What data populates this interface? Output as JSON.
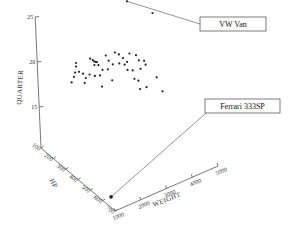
{
  "chart_data": {
    "type": "scatter",
    "projection": "3d",
    "title": "",
    "axes": {
      "x": {
        "label": "WEIGHT",
        "range": [
          1000,
          5000
        ],
        "ticks": [
          1000,
          2000,
          3000,
          4000,
          5000
        ]
      },
      "y": {
        "label": "HP",
        "range": [
          100,
          700
        ],
        "ticks": [
          100,
          200,
          300,
          400,
          500,
          600,
          700
        ]
      },
      "z": {
        "label": "QUARTER",
        "range": [
          10,
          25
        ],
        "ticks": [
          15,
          20,
          25
        ]
      }
    },
    "grid": false,
    "points": [
      {
        "WEIGHT": 2250,
        "HP": 150,
        "QUARTER": 18.9
      },
      {
        "WEIGHT": 2250,
        "HP": 150,
        "QUARTER": 18.5
      },
      {
        "WEIGHT": 2200,
        "HP": 150,
        "QUARTER": 17.9
      },
      {
        "WEIGHT": 2150,
        "HP": 150,
        "QUARTER": 17.5
      },
      {
        "WEIGHT": 2350,
        "HP": 150,
        "QUARTER": 17.8
      },
      {
        "WEIGHT": 2050,
        "HP": 150,
        "QUARTER": 17.0
      },
      {
        "WEIGHT": 2500,
        "HP": 150,
        "QUARTER": 17.4
      },
      {
        "WEIGHT": 2600,
        "HP": 150,
        "QUARTER": 16.8
      },
      {
        "WEIGHT": 2550,
        "HP": 150,
        "QUARTER": 16.3
      },
      {
        "WEIGHT": 2750,
        "HP": 150,
        "QUARTER": 17.0
      },
      {
        "WEIGHT": 2800,
        "HP": 150,
        "QUARTER": 18.7
      },
      {
        "WEIGHT": 2900,
        "HP": 150,
        "QUARTER": 18.4
      },
      {
        "WEIGHT": 2950,
        "HP": 150,
        "QUARTER": 18.2
      },
      {
        "WEIGHT": 3000,
        "HP": 150,
        "QUARTER": 18.1
      },
      {
        "WEIGHT": 3050,
        "HP": 150,
        "QUARTER": 18.0
      },
      {
        "WEIGHT": 2950,
        "HP": 150,
        "QUARTER": 17.8
      },
      {
        "WEIGHT": 3100,
        "HP": 150,
        "QUARTER": 17.6
      },
      {
        "WEIGHT": 2950,
        "HP": 150,
        "QUARTER": 16.6
      },
      {
        "WEIGHT": 3150,
        "HP": 150,
        "QUARTER": 16.4
      },
      {
        "WEIGHT": 3250,
        "HP": 150,
        "QUARTER": 16.9
      },
      {
        "WEIGHT": 3400,
        "HP": 150,
        "QUARTER": 18.3
      },
      {
        "WEIGHT": 3500,
        "HP": 150,
        "QUARTER": 17.6
      },
      {
        "WEIGHT": 3450,
        "HP": 150,
        "QUARTER": 16.7
      },
      {
        "WEIGHT": 3650,
        "HP": 150,
        "QUARTER": 17.0
      },
      {
        "WEIGHT": 3750,
        "HP": 150,
        "QUARTER": 18.2
      },
      {
        "WEIGHT": 3900,
        "HP": 150,
        "QUARTER": 17.8
      },
      {
        "WEIGHT": 3900,
        "HP": 150,
        "QUARTER": 16.8
      },
      {
        "WEIGHT": 4050,
        "HP": 150,
        "QUARTER": 17.2
      },
      {
        "WEIGHT": 4100,
        "HP": 150,
        "QUARTER": 16.4
      },
      {
        "WEIGHT": 4200,
        "HP": 150,
        "QUARTER": 16.6
      },
      {
        "WEIGHT": 4300,
        "HP": 150,
        "QUARTER": 17.4
      },
      {
        "WEIGHT": 4200,
        "HP": 150,
        "QUARTER": 15.7
      },
      {
        "WEIGHT": 4400,
        "HP": 150,
        "QUARTER": 15.4
      },
      {
        "WEIGHT": 4550,
        "HP": 150,
        "QUARTER": 16.9
      },
      {
        "WEIGHT": 4650,
        "HP": 150,
        "QUARTER": 16.2
      },
      {
        "WEIGHT": 4700,
        "HP": 150,
        "QUARTER": 15.2
      },
      {
        "WEIGHT": 4850,
        "HP": 150,
        "QUARTER": 15.9
      },
      {
        "WEIGHT": 4900,
        "HP": 150,
        "QUARTER": 15.4
      },
      {
        "WEIGHT": 4450,
        "HP": 150,
        "QUARTER": 14.4
      },
      {
        "WEIGHT": 4600,
        "HP": 150,
        "QUARTER": 14.0
      },
      {
        "WEIGHT": 4650,
        "HP": 150,
        "QUARTER": 13.0
      },
      {
        "WEIGHT": 4900,
        "HP": 150,
        "QUARTER": 12.9
      },
      {
        "WEIGHT": 5300,
        "HP": 150,
        "QUARTER": 13.5
      },
      {
        "WEIGHT": 5500,
        "HP": 150,
        "QUARTER": 11.7
      },
      {
        "WEIGHT": 5250,
        "HP": 150,
        "QUARTER": 20.7
      },
      {
        "WEIGHT": 3200,
        "HP": 150,
        "QUARTER": 15.1
      },
      {
        "WEIGHT": 3600,
        "HP": 150,
        "QUARTER": 15.3
      }
    ],
    "annotations": [
      {
        "label": "VW Van",
        "point": {
          "WEIGHT": 4300,
          "HP": 150,
          "QUARTER": 23.2
        }
      },
      {
        "label": "Ferrari 333SP",
        "point": {
          "WEIGHT": 1100,
          "HP": 650,
          "QUARTER": 11.3
        }
      }
    ]
  }
}
